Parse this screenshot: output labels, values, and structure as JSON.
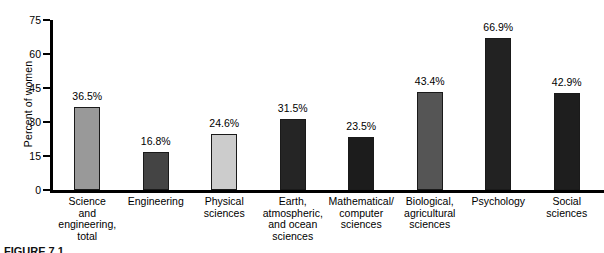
{
  "chart_data": {
    "type": "bar",
    "title": "",
    "xlabel": "",
    "ylabel": "Percent of women",
    "ylim": [
      0,
      75
    ],
    "yticks": [
      "0",
      "15",
      "30",
      "45",
      "60",
      "75"
    ],
    "grid": false,
    "legend": "none",
    "categories": [
      "Science\nand\nengineering,\ntotal",
      "Engineering",
      "Physical\nsciences",
      "Earth,\natmospheric,\nand ocean\nsciences",
      "Mathematical/\ncomputer\nsciences",
      "Biological,\nagricultural\nsciences",
      "Psychology",
      "Social\nsciences"
    ],
    "values": [
      36.5,
      16.8,
      24.6,
      31.5,
      23.5,
      43.4,
      66.9,
      42.9
    ],
    "value_labels": [
      "36.5%",
      "16.8%",
      "24.6%",
      "31.5%",
      "23.5%",
      "43.4%",
      "66.9%",
      "42.9%"
    ],
    "bar_colors": [
      "#999999",
      "#444444",
      "#cccccc",
      "#252525",
      "#1c1c1c",
      "#555555",
      "#222222",
      "#1e1e1e"
    ]
  },
  "caption": "FIGURE 7.1"
}
